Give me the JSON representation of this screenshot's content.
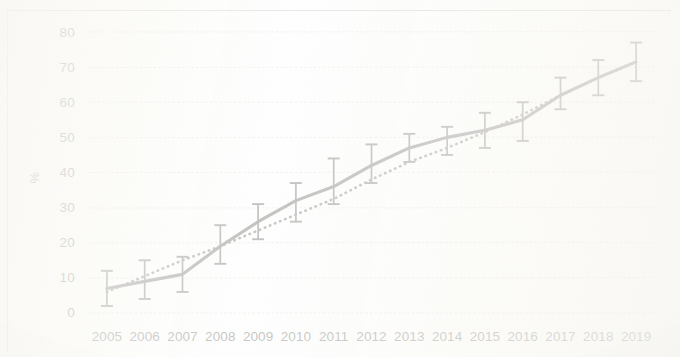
{
  "chart_data": {
    "type": "line",
    "title": "",
    "subtitle": "",
    "xlabel": "",
    "ylabel": "%",
    "categories": [
      "2005",
      "2006",
      "2007",
      "2008",
      "2009",
      "2010",
      "2011",
      "2012",
      "2013",
      "2014",
      "2015",
      "2016",
      "2017",
      "2018",
      "2019"
    ],
    "ylim": [
      0,
      80
    ],
    "xlim_labels": [
      "2005",
      "2019"
    ],
    "y_ticks": [
      "0",
      "10",
      "20",
      "30",
      "40",
      "50",
      "60",
      "70",
      "80"
    ],
    "y_tick_values": [
      0,
      10,
      20,
      30,
      40,
      50,
      60,
      70,
      80
    ],
    "grid": true,
    "grid_style": "dashed-horizontal",
    "legend": "none",
    "series": [
      {
        "name": "observed",
        "style": "solid",
        "color": "#6b6a67",
        "values": [
          7,
          9,
          11,
          19,
          26,
          32,
          36,
          42,
          47,
          50,
          52,
          55,
          62,
          67,
          71.5
        ],
        "error_low": [
          2,
          4,
          6,
          14,
          21,
          26,
          31,
          37,
          43,
          45,
          47,
          49,
          58,
          62,
          66
        ],
        "error_high": [
          12,
          15,
          16,
          25,
          31,
          37,
          44,
          48,
          51,
          53,
          57,
          60,
          67,
          72,
          77
        ]
      },
      {
        "name": "trend",
        "style": "dotted",
        "color": "#777572",
        "values": [
          6,
          10.5,
          15,
          19,
          23.5,
          28,
          32.5,
          38,
          43,
          47,
          51.5,
          56.5,
          62,
          67,
          71.5
        ]
      }
    ],
    "annotations": []
  },
  "colors": {
    "background": "#fdfdfb",
    "line": "#6b6a67",
    "trendline": "#777572",
    "gridline": "#d8d6d1",
    "tick_text": "#6f6d69",
    "frame": "#96948f"
  },
  "axes": {
    "y_title": "%",
    "y_tick_labels": [
      "80",
      "70",
      "60",
      "50",
      "40",
      "30",
      "20",
      "10",
      "0"
    ],
    "x_tick_labels": [
      "2005",
      "2006",
      "2007",
      "2008",
      "2009",
      "2010",
      "2011",
      "2012",
      "2013",
      "2014",
      "2015",
      "2016",
      "2017",
      "2018",
      "2019"
    ]
  }
}
